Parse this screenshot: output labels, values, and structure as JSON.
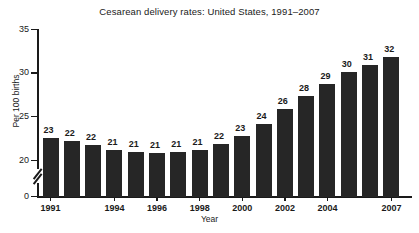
{
  "chart_data": {
    "type": "bar",
    "title": "Cesarean delivery rates: United States, 1991–2007",
    "xlabel": "Year",
    "ylabel": "Per 100 births",
    "categories": [
      "1991",
      "1992",
      "1993",
      "1994",
      "1995",
      "1996",
      "1997",
      "1998",
      "1999",
      "2000",
      "2001",
      "2002",
      "2003",
      "2004",
      "2005",
      "2006",
      "2007"
    ],
    "values": [
      23,
      22,
      22,
      21,
      21,
      21,
      21,
      21,
      22,
      23,
      24,
      26,
      28,
      29,
      30,
      31,
      32
    ],
    "bar_tops_precise": [
      22.6,
      22.3,
      21.8,
      21.3,
      21.0,
      20.9,
      21.0,
      21.3,
      21.9,
      22.9,
      24.2,
      25.9,
      27.5,
      28.8,
      30.2,
      31.0,
      31.9
    ],
    "data_labels": [
      "23",
      "22",
      "22",
      "21",
      "21",
      "21",
      "21",
      "21",
      "22",
      "23",
      "24",
      "26",
      "28",
      "29",
      "30",
      "31",
      "32"
    ],
    "x_tick_labels": [
      "1991",
      "1994",
      "1996",
      "1998",
      "2000",
      "2002",
      "2004",
      "2007"
    ],
    "x_tick_categories": [
      "1991",
      "1994",
      "1996",
      "1998",
      "2000",
      "2002",
      "2004",
      "2007"
    ],
    "y_ticks": [
      0,
      20,
      25,
      30,
      35
    ],
    "y_tick_labels": [
      "0",
      "20",
      "25",
      "30",
      "35"
    ],
    "ylim": [
      0,
      35
    ],
    "y_axis_break": true,
    "y_axis_break_between": [
      0,
      20
    ],
    "grid": false,
    "legend": false,
    "bar_color": "#262626",
    "axis_color": "#1a1a1a",
    "background_color": "#ffffff"
  }
}
